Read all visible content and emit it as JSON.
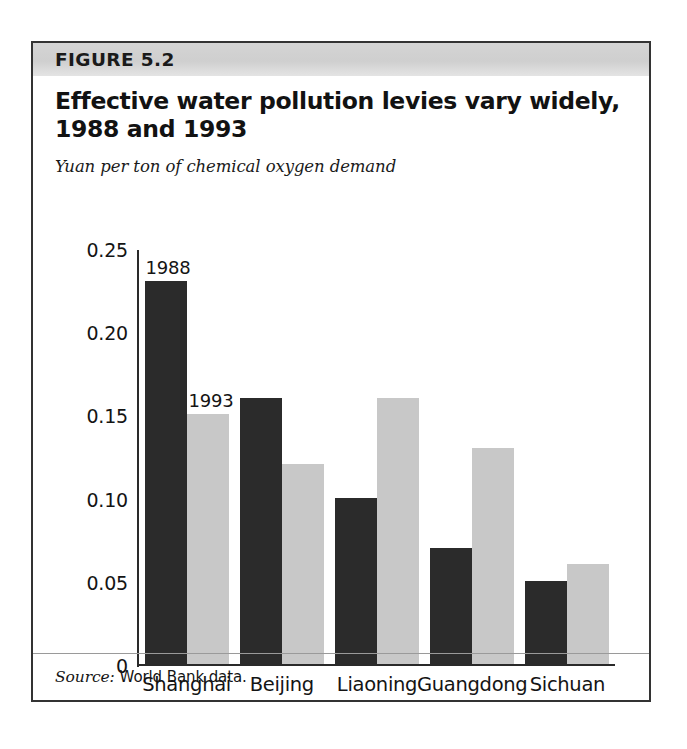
{
  "figure": {
    "number_label": "FIGURE 5.2",
    "title": "Effective water pollution levies vary widely, 1988 and 1993",
    "title_line1": "Effective water pollution levies vary widely,",
    "title_line2": "1988 and 1993",
    "subtitle": "Yuan per ton of chemical oxygen demand",
    "source_label": "Source:",
    "source_text": "World Bank data."
  },
  "colors": {
    "series_1988": "#2b2b2b",
    "series_1993": "#c8c8c8",
    "header_band": "#d0d0d0",
    "frame": "#333333",
    "axis": "#2a2a2a"
  },
  "chart_data": {
    "type": "bar",
    "title": "Effective water pollution levies vary widely, 1988 and 1993",
    "subtitle": "Yuan per ton of chemical oxygen demand",
    "xlabel": "",
    "ylabel": "Yuan per ton of chemical oxygen demand",
    "ylim": [
      0,
      0.25
    ],
    "grid": false,
    "legend_position": "inline-annotations",
    "ytick_labels": [
      "0",
      "0.05",
      "0.10",
      "0.15",
      "0.20",
      "0.25"
    ],
    "ytick_values": [
      0,
      0.05,
      0.1,
      0.15,
      0.2,
      0.25
    ],
    "categories": [
      "Shanghai",
      "Beijing",
      "Liaoning",
      "Guangdong",
      "Sichuan"
    ],
    "series": [
      {
        "name": "1988",
        "color": "#2b2b2b",
        "values": [
          0.23,
          0.16,
          0.1,
          0.07,
          0.05
        ]
      },
      {
        "name": "1993",
        "color": "#c8c8c8",
        "values": [
          0.15,
          0.12,
          0.16,
          0.13,
          0.06
        ]
      }
    ],
    "annotations": [
      {
        "text": "1988",
        "series": "1988",
        "category": "Shanghai"
      },
      {
        "text": "1993",
        "series": "1993",
        "category": "Shanghai"
      }
    ],
    "source": "World Bank data."
  }
}
